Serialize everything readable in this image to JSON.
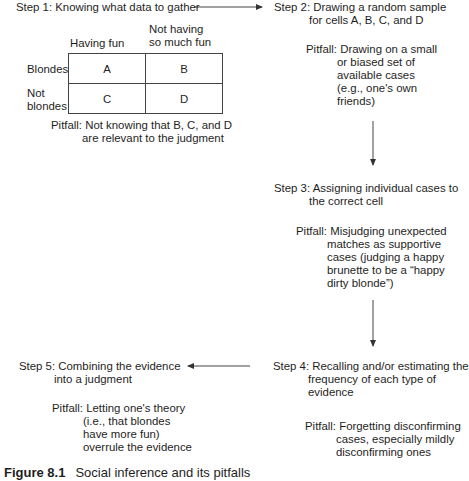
{
  "figure": {
    "caption_number": "Figure 8.1",
    "caption_text": "Social inference and its pitfalls"
  },
  "step1": {
    "title": "Step 1: Knowing what data to gather",
    "table": {
      "col_headers": [
        "Having fun",
        "Not having so much fun"
      ],
      "col_header_lines": [
        [
          "Having fun"
        ],
        [
          "Not having",
          "so much fun"
        ]
      ],
      "row_headers": [
        "Blondes",
        "Not blondes"
      ],
      "row_header_lines": [
        [
          "Blondes"
        ],
        [
          "Not",
          "blondes"
        ]
      ],
      "cells": [
        [
          "A",
          "B"
        ],
        [
          "C",
          "D"
        ]
      ]
    },
    "pitfall_lines": [
      "Pitfall: Not knowing that B, C, and D",
      "are relevant to the judgment"
    ]
  },
  "step2": {
    "title_lines": [
      "Step 2: Drawing a random sample",
      "for cells A, B, C, and D"
    ],
    "pitfall_lines": [
      "Pitfall: Drawing on a small",
      "or biased set of",
      "available cases",
      "(e.g., one's own",
      "friends)"
    ]
  },
  "step3": {
    "title_lines": [
      "Step 3: Assigning individual cases to",
      "the correct cell"
    ],
    "pitfall_lines": [
      "Pitfall: Misjudging unexpected",
      "matches as supportive",
      "cases (judging a happy",
      "brunette to be a “happy",
      "dirty blonde”)"
    ]
  },
  "step4": {
    "title_lines": [
      "Step 4: Recalling and/or estimating the",
      "frequency of each type of",
      "evidence"
    ],
    "pitfall_lines": [
      "Pitfall: Forgetting disconfirming",
      "cases, especially mildly",
      "disconfirming ones"
    ]
  },
  "step5": {
    "title_lines": [
      "Step 5: Combining the evidence",
      "into a judgment"
    ],
    "pitfall_lines": [
      "Pitfall: Letting one's theory",
      "(i.e., that blondes",
      "have more fun)",
      "overrule the evidence"
    ]
  },
  "colors": {
    "text": "#1e1e1e",
    "lines": "#444444"
  }
}
